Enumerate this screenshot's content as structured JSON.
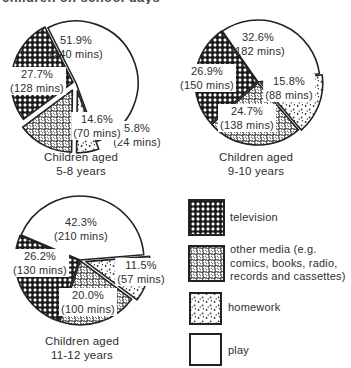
{
  "header": {
    "clipped_title": "children on school days"
  },
  "colors": {
    "ink": "#222222",
    "background": "#ffffff",
    "label_text": "#2e2e2e"
  },
  "legend": {
    "position": "bottom-right",
    "items": [
      {
        "key": "television",
        "label": "television"
      },
      {
        "key": "other_media",
        "label": "other media (e.g. comics, books, radio, records and cassettes)"
      },
      {
        "key": "homework",
        "label": "homework"
      },
      {
        "key": "play",
        "label": "play"
      }
    ]
  },
  "chart_data": [
    {
      "type": "pie",
      "caption_line1": "Children aged",
      "caption_line2": "5-8 years",
      "layout": {
        "cx": 76,
        "cy": 83,
        "r": 62,
        "start_angle_deg": 117
      },
      "slices": [
        {
          "category": "play",
          "pct": 51.9,
          "mins": 240,
          "pct_label": "51.9%",
          "mins_label": "(240 mins)",
          "explode": 0,
          "label_dx": 0,
          "label_dy": -36,
          "box": false
        },
        {
          "category": "homework",
          "pct": 5.8,
          "mins": 24,
          "pct_label": "5.8%",
          "mins_label": "(24 mins)",
          "explode": 8,
          "label_dx": 61,
          "label_dy": 52,
          "box": true
        },
        {
          "category": "other_media",
          "pct": 14.6,
          "mins": 70,
          "pct_label": "14.6%",
          "mins_label": "(70 mins)",
          "explode": 8,
          "label_dx": 21,
          "label_dy": 43,
          "box": true
        },
        {
          "category": "television",
          "pct": 27.7,
          "mins": 128,
          "pct_label": "27.7%",
          "mins_label": "(128 mins)",
          "explode": 3,
          "label_dx": -39,
          "label_dy": -2,
          "box": true
        }
      ]
    },
    {
      "type": "pie",
      "caption_line1": "Children aged",
      "caption_line2": "9-10 years",
      "layout": {
        "cx": 258,
        "cy": 82,
        "r": 62,
        "start_angle_deg": 125
      },
      "slices": [
        {
          "category": "play",
          "pct": 32.6,
          "mins": 182,
          "pct_label": "32.6%",
          "mins_label": "(182 mins)",
          "explode": 0,
          "label_dx": 0,
          "label_dy": -38,
          "box": false
        },
        {
          "category": "homework",
          "pct": 15.8,
          "mins": 88,
          "pct_label": "15.8%",
          "mins_label": "(88 mins)",
          "explode": 3,
          "label_dx": 31,
          "label_dy": 6,
          "box": true
        },
        {
          "category": "other_media",
          "pct": 24.7,
          "mins": 138,
          "pct_label": "24.7%",
          "mins_label": "(138 mins)",
          "explode": 1,
          "label_dx": -11,
          "label_dy": 36,
          "box": true
        },
        {
          "category": "television",
          "pct": 26.9,
          "mins": 150,
          "pct_label": "26.9%",
          "mins_label": "(150 mins)",
          "explode": 1,
          "label_dx": -51,
          "label_dy": -4,
          "box": true
        }
      ]
    },
    {
      "type": "pie",
      "caption_line1": "Children aged",
      "caption_line2": "11-12 years",
      "layout": {
        "cx": 80,
        "cy": 260,
        "r": 64,
        "start_angle_deg": 157
      },
      "slices": [
        {
          "category": "play",
          "pct": 42.3,
          "mins": 210,
          "pct_label": "42.3%",
          "mins_label": "(210 mins)",
          "explode": 0,
          "label_dx": 1,
          "label_dy": -31,
          "box": false
        },
        {
          "category": "homework",
          "pct": 11.5,
          "mins": 57,
          "pct_label": "11.5%",
          "mins_label": "(57 mins)",
          "explode": 6,
          "label_dx": 61,
          "label_dy": 12,
          "box": true
        },
        {
          "category": "other_media",
          "pct": 20.0,
          "mins": 100,
          "pct_label": "20.0%",
          "mins_label": "(100 mins)",
          "explode": 1,
          "label_dx": 8,
          "label_dy": 42,
          "box": true
        },
        {
          "category": "television",
          "pct": 26.2,
          "mins": 130,
          "pct_label": "26.2%",
          "mins_label": "(130 mins)",
          "explode": 1,
          "label_dx": -40,
          "label_dy": 3,
          "box": true
        }
      ]
    }
  ]
}
